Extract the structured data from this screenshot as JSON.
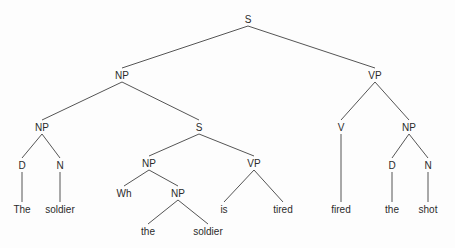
{
  "diagram": {
    "type": "syntax-tree",
    "sentence": "The soldier Wh the soldier is tired fired the shot",
    "colors": {
      "background": "#fdfdfd",
      "line": "#555555",
      "text": "#2b2b2b"
    },
    "nodes": [
      {
        "id": "s-root",
        "label": "S",
        "x": 248,
        "y": 19,
        "kind": "nonterminal"
      },
      {
        "id": "np-subj",
        "label": "NP",
        "x": 122,
        "y": 75,
        "kind": "nonterminal"
      },
      {
        "id": "vp-main",
        "label": "VP",
        "x": 375,
        "y": 75,
        "kind": "nonterminal"
      },
      {
        "id": "np-head",
        "label": "NP",
        "x": 42,
        "y": 127,
        "kind": "nonterminal"
      },
      {
        "id": "s-rel",
        "label": "S",
        "x": 199,
        "y": 127,
        "kind": "nonterminal"
      },
      {
        "id": "v-main",
        "label": "V",
        "x": 341,
        "y": 127,
        "kind": "nonterminal"
      },
      {
        "id": "np-obj",
        "label": "NP",
        "x": 409,
        "y": 127,
        "kind": "nonterminal"
      },
      {
        "id": "d-subj",
        "label": "D",
        "x": 22,
        "y": 165,
        "kind": "nonterminal"
      },
      {
        "id": "n-subj",
        "label": "N",
        "x": 60,
        "y": 165,
        "kind": "nonterminal"
      },
      {
        "id": "np-rel",
        "label": "NP",
        "x": 149,
        "y": 163,
        "kind": "nonterminal"
      },
      {
        "id": "vp-rel",
        "label": "VP",
        "x": 254,
        "y": 163,
        "kind": "nonterminal"
      },
      {
        "id": "d-obj",
        "label": "D",
        "x": 392,
        "y": 165,
        "kind": "nonterminal"
      },
      {
        "id": "n-obj",
        "label": "N",
        "x": 428,
        "y": 165,
        "kind": "nonterminal"
      },
      {
        "id": "wh",
        "label": "Wh",
        "x": 124,
        "y": 193,
        "kind": "nonterminal"
      },
      {
        "id": "np-trace",
        "label": "NP",
        "x": 178,
        "y": 193,
        "kind": "nonterminal"
      },
      {
        "id": "t-the1",
        "label": "The",
        "x": 22,
        "y": 209,
        "kind": "terminal"
      },
      {
        "id": "t-soldier1",
        "label": "soldier",
        "x": 60,
        "y": 209,
        "kind": "terminal"
      },
      {
        "id": "t-is",
        "label": "is",
        "x": 224,
        "y": 209,
        "kind": "terminal"
      },
      {
        "id": "t-tired",
        "label": "tired",
        "x": 283,
        "y": 209,
        "kind": "terminal"
      },
      {
        "id": "t-fired",
        "label": "fired",
        "x": 341,
        "y": 209,
        "kind": "terminal"
      },
      {
        "id": "t-the2",
        "label": "the",
        "x": 392,
        "y": 209,
        "kind": "terminal"
      },
      {
        "id": "t-shot",
        "label": "shot",
        "x": 428,
        "y": 209,
        "kind": "terminal"
      },
      {
        "id": "t-the3",
        "label": "the",
        "x": 148,
        "y": 231,
        "kind": "terminal"
      },
      {
        "id": "t-soldier2",
        "label": "soldier",
        "x": 208,
        "y": 231,
        "kind": "terminal"
      }
    ],
    "edges": [
      {
        "from": "s-root",
        "to": "np-subj"
      },
      {
        "from": "s-root",
        "to": "vp-main"
      },
      {
        "from": "np-subj",
        "to": "np-head"
      },
      {
        "from": "np-subj",
        "to": "s-rel"
      },
      {
        "from": "vp-main",
        "to": "v-main"
      },
      {
        "from": "vp-main",
        "to": "np-obj"
      },
      {
        "from": "np-head",
        "to": "d-subj"
      },
      {
        "from": "np-head",
        "to": "n-subj"
      },
      {
        "from": "s-rel",
        "to": "np-rel"
      },
      {
        "from": "s-rel",
        "to": "vp-rel"
      },
      {
        "from": "np-obj",
        "to": "d-obj"
      },
      {
        "from": "np-obj",
        "to": "n-obj"
      },
      {
        "from": "d-subj",
        "to": "t-the1"
      },
      {
        "from": "n-subj",
        "to": "t-soldier1"
      },
      {
        "from": "np-rel",
        "to": "wh"
      },
      {
        "from": "np-rel",
        "to": "np-trace"
      },
      {
        "from": "vp-rel",
        "to": "t-is"
      },
      {
        "from": "vp-rel",
        "to": "t-tired"
      },
      {
        "from": "v-main",
        "to": "t-fired"
      },
      {
        "from": "d-obj",
        "to": "t-the2"
      },
      {
        "from": "n-obj",
        "to": "t-shot"
      },
      {
        "from": "np-trace",
        "to": "t-the3"
      },
      {
        "from": "np-trace",
        "to": "t-soldier2"
      }
    ]
  }
}
